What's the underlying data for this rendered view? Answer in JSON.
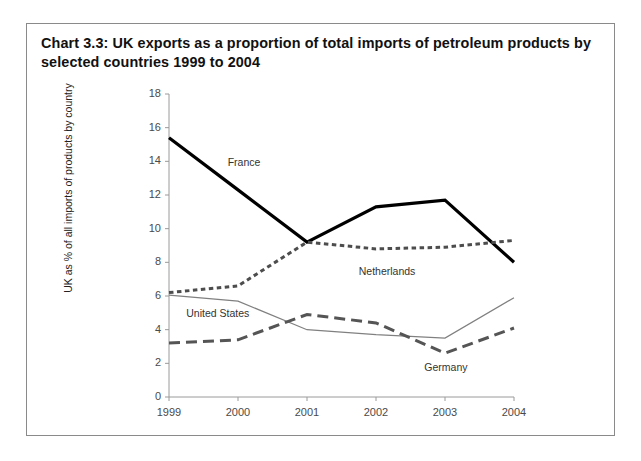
{
  "figure": {
    "title": "Chart 3.3:  UK exports as a proportion of total imports of petroleum products by selected countries 1999 to 2004"
  },
  "chart_data": {
    "type": "line",
    "title": "Chart 3.3:  UK exports as a proportion of total imports of petroleum products by selected countries 1999 to 2004",
    "xlabel": "",
    "ylabel": "UK as % of all imports of products by country",
    "categories": [
      "1999",
      "2000",
      "2001",
      "2002",
      "2003",
      "2004"
    ],
    "x": [
      1999,
      2000,
      2001,
      2002,
      2003,
      2004
    ],
    "ylim": [
      0,
      18
    ],
    "yticks": [
      0,
      2,
      4,
      6,
      8,
      10,
      12,
      14,
      16,
      18
    ],
    "ytick_labels": [
      "0",
      "2",
      "4",
      "6",
      "8",
      "10",
      "12",
      "14",
      "16",
      "18"
    ],
    "xtick_labels": [
      "1999",
      "2000",
      "2001",
      "2002",
      "2003",
      "2004"
    ],
    "grid": false,
    "legend": "inline-labels",
    "series": [
      {
        "name": "France",
        "values": [
          15.4,
          12.3,
          9.2,
          11.3,
          11.7,
          8.0
        ],
        "style": "solid-thick",
        "color": "#000000",
        "label_x": 1999.85,
        "label_y": 13.9
      },
      {
        "name": "Netherlands",
        "values": [
          6.2,
          6.6,
          9.2,
          8.8,
          8.9,
          9.3
        ],
        "style": "dotted",
        "color": "#4d4d4d",
        "label_x": 2001.75,
        "label_y": 7.45
      },
      {
        "name": "United States",
        "values": [
          6.05,
          5.7,
          4.0,
          3.7,
          3.5,
          5.9
        ],
        "style": "solid-thin",
        "color": "#808080",
        "label_x": 1999.25,
        "label_y": 4.95
      },
      {
        "name": "Germany",
        "values": [
          3.2,
          3.4,
          4.9,
          4.4,
          2.6,
          4.1
        ],
        "style": "dashed",
        "color": "#555555",
        "label_x": 2002.7,
        "label_y": 1.75
      }
    ]
  },
  "ticks": {
    "y": [
      "18",
      "16",
      "14",
      "12",
      "10",
      "8",
      "6",
      "4",
      "2",
      "0"
    ],
    "x": [
      "1999",
      "2000",
      "2001",
      "2002",
      "2003",
      "2004"
    ]
  },
  "labels": {
    "france": "France",
    "netherlands": "Netherlands",
    "united_states": "United States",
    "germany": "Germany",
    "y_axis": "UK as % of all imports of products by country"
  }
}
